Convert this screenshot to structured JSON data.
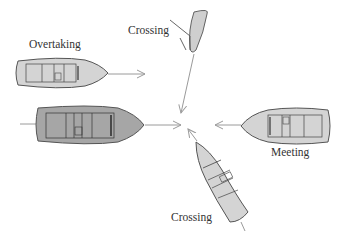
{
  "diagram": {
    "type": "boat-encounter-situations",
    "labels": {
      "overtaking": "Overtaking",
      "crossing_top": "Crossing",
      "meeting": "Meeting",
      "crossing_bottom": "Crossing"
    },
    "colors": {
      "hull_light": "#d4d4d4",
      "hull_dark": "#a6a6a6",
      "outline": "#555555",
      "arrow": "#9a9a9a",
      "text": "#333333"
    },
    "center_point": [
      185,
      125
    ]
  }
}
